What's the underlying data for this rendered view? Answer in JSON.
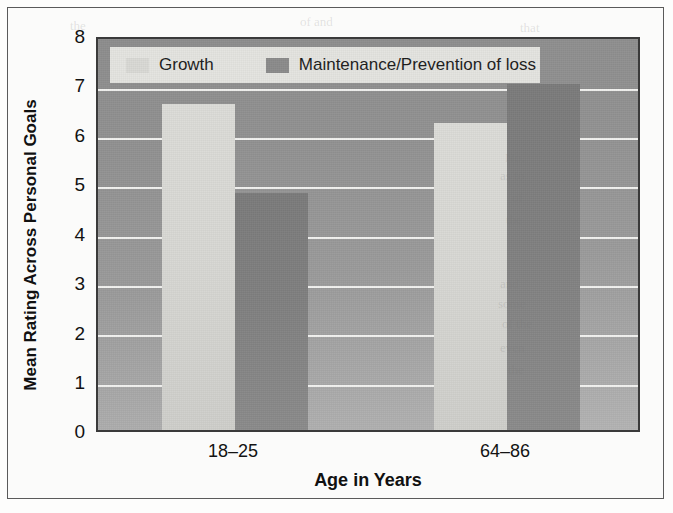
{
  "figure": {
    "background_color": "#fbfbfa",
    "border_color": "#5a5a5a"
  },
  "legend": {
    "position": "top-left-inside",
    "background_color": "#e4e4e0",
    "items": [
      {
        "label": "Growth",
        "color": "#d9d9d5",
        "swatch_name": "growth-swatch"
      },
      {
        "label": "Maintenance/Prevention of loss",
        "color": "#8b8b8b",
        "swatch_name": "maintenance-swatch"
      }
    ]
  },
  "axes": {
    "y_title": "Mean Rating Across Personal Goals",
    "x_title": "Age in Years",
    "y_ticks": [
      "0",
      "1",
      "2",
      "3",
      "4",
      "5",
      "6",
      "7",
      "8"
    ],
    "x_ticks": [
      "18–25",
      "64–86"
    ]
  },
  "chart_data": {
    "type": "bar",
    "title": "",
    "xlabel": "Age in Years",
    "ylabel": "Mean Rating Across Personal Goals",
    "categories": [
      "18–25",
      "64–86"
    ],
    "ylim": [
      0,
      8
    ],
    "ytick_step": 1,
    "grid": true,
    "legend_position": "upper left inside plot",
    "series": [
      {
        "name": "Growth",
        "color": "#d9d9d5",
        "values": [
          6.6,
          6.2
        ]
      },
      {
        "name": "Maintenance/Prevention of loss",
        "color": "#8b8b8b",
        "values": [
          4.8,
          7.0
        ]
      }
    ]
  },
  "bleed_through": [
    {
      "text": "the",
      "x": 70,
      "y": 18
    },
    {
      "text": "of and",
      "x": 300,
      "y": 14
    },
    {
      "text": "that",
      "x": 520,
      "y": 20
    },
    {
      "text": "No.",
      "x": 505,
      "y": 150
    },
    {
      "text": "as to",
      "x": 500,
      "y": 168
    },
    {
      "text": "of",
      "x": 512,
      "y": 190
    },
    {
      "text": "the",
      "x": 506,
      "y": 212
    },
    {
      "text": "and",
      "x": 500,
      "y": 276
    },
    {
      "text": "some",
      "x": 498,
      "y": 296
    },
    {
      "text": "of the",
      "x": 502,
      "y": 316
    },
    {
      "text": "even",
      "x": 500,
      "y": 340
    },
    {
      "text": "the",
      "x": 508,
      "y": 362
    }
  ]
}
